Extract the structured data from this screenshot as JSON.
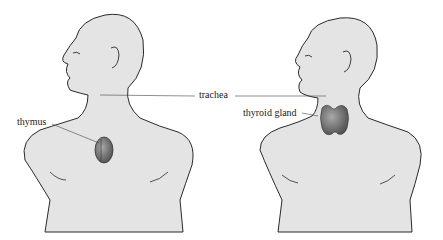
{
  "diagram": {
    "type": "anatomical-illustration",
    "figures": [
      {
        "id": "left",
        "organ": "thymus"
      },
      {
        "id": "right",
        "organ": "thyroid gland"
      }
    ],
    "labels": {
      "thymus": "thymus",
      "trachea": "trachea",
      "thyroid": "thyroid gland"
    },
    "colors": {
      "skin": "#e4e4e4",
      "outline": "#2a2a2a",
      "organ": "#6e6e6e",
      "leader": "#444444"
    }
  }
}
